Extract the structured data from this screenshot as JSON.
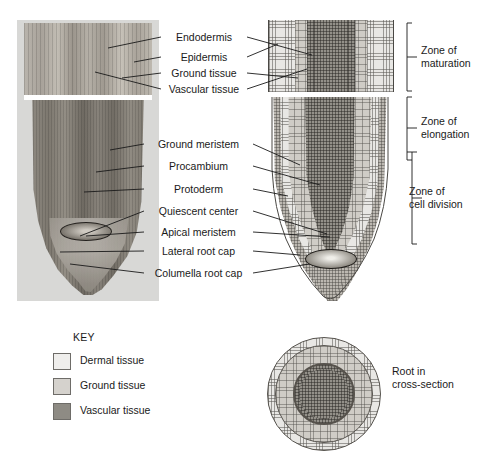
{
  "structure_labels": [
    {
      "id": "endodermis",
      "text": "Endodermis"
    },
    {
      "id": "epidermis",
      "text": "Epidermis"
    },
    {
      "id": "ground-tissue",
      "text": "Ground tissue"
    },
    {
      "id": "vascular-tissue",
      "text": "Vascular tissue"
    },
    {
      "id": "ground-meristem",
      "text": "Ground meristem"
    },
    {
      "id": "procambium",
      "text": "Procambium"
    },
    {
      "id": "protoderm",
      "text": "Protoderm"
    },
    {
      "id": "quiescent-center",
      "text": "Quiescent center"
    },
    {
      "id": "apical-meristem",
      "text": "Apical meristem"
    },
    {
      "id": "lateral-root-cap",
      "text": "Lateral root cap"
    },
    {
      "id": "columella-root-cap",
      "text": "Columella root cap"
    }
  ],
  "zones": [
    {
      "id": "maturation",
      "line1": "Zone of",
      "line2": "maturation"
    },
    {
      "id": "elongation",
      "line1": "Zone of",
      "line2": "elongation"
    },
    {
      "id": "cell-division",
      "line1": "Zone of",
      "line2": "cell division"
    }
  ],
  "key": {
    "title": "KEY",
    "items": [
      {
        "id": "dermal",
        "label": "Dermal tissue",
        "color": "#efeeec"
      },
      {
        "id": "ground",
        "label": "Ground tissue",
        "color": "#d5d2cd"
      },
      {
        "id": "vascular",
        "label": "Vascular tissue",
        "color": "#8e8b84"
      }
    ]
  },
  "cross_section": {
    "caption_line1": "Root in",
    "caption_line2": "cross-section"
  },
  "colors": {
    "dermal": "#efeeec",
    "ground": "#d5d2cd",
    "vascular": "#8e8b84",
    "line": "#1a1a1a",
    "photo_backdrop": "#d8d8d6",
    "page_background": "#ffffff"
  }
}
